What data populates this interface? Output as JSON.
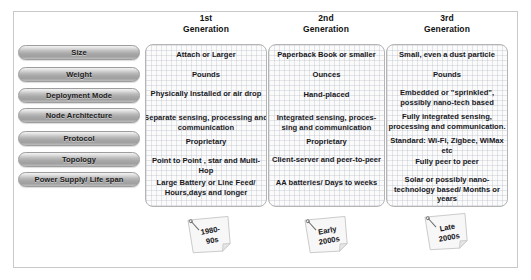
{
  "generations": [
    {
      "header_line1": "1st",
      "header_line2": "Generation",
      "year_line1": "1980-",
      "year_line2": "90s",
      "rows": [
        "Attach or Larger",
        "Pounds",
        "Physically Installed or air drop",
        "Separate sensing, processing and communication",
        "Proprietary",
        "Point to Point , star and Multi-Hop",
        "Large Battery or Line Feed/ Hours,days and longer"
      ]
    },
    {
      "header_line1": "2nd",
      "header_line2": "Generation",
      "year_line1": "Early",
      "year_line2": "2000s",
      "rows": [
        "Paperback Book or smaller",
        "Ounces",
        "Hand-placed",
        "Integrated sensing, proces-sing and communication",
        "Proprietary",
        "Client-server and peer-to-peer",
        "AA batteries/ Days to weeks"
      ]
    },
    {
      "header_line1": "3rd",
      "header_line2": "Generation",
      "year_line1": "Late",
      "year_line2": "2000s",
      "rows": [
        "Small, even a dust particle",
        "Pounds",
        "Embedded or \"sprinkled\", possibly nano-tech based",
        "Fully integrated sensing, processing and communication.",
        "Standard: Wi-Fi, Zigbee, WiMax etc",
        "Fully peer to peer",
        "Solar or possibly nano-technology based/ Months or years"
      ]
    }
  ],
  "attributes": [
    {
      "label": "Size"
    },
    {
      "label": "Weight"
    },
    {
      "label": "Deployment Mode"
    },
    {
      "label": "Node Architecture"
    },
    {
      "label": "Protocol"
    },
    {
      "label": "Topology"
    },
    {
      "label": "Power Supply/ Life span"
    }
  ],
  "colors": {
    "frame_border": "#c9c9c9",
    "pill_border": "#9d9d9d",
    "column_border": "#b4b4b4",
    "grid_line": "#aab2be",
    "text": "#17171b",
    "background": "#ffffff"
  }
}
